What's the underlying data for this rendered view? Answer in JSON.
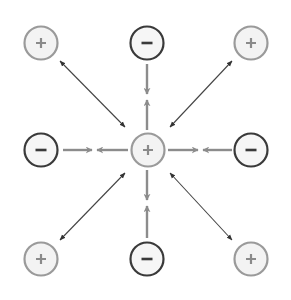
{
  "diagram": {
    "colors": {
      "background": "#ffffff",
      "positive_stroke": "#9a9a9a",
      "positive_fill": "#f3f3f3",
      "positive_sign": "#8a8a8a",
      "negative_stroke": "#3a3a3a",
      "negative_fill": "#f6f6f6",
      "negative_sign": "#3a3a3a",
      "attraction_arrow": "#8c8c8c",
      "diagonal_arrow": "#444444"
    },
    "nodes": [
      {
        "id": "top-left",
        "charge": "positive",
        "symbol": "+",
        "cx": 41,
        "cy": 43
      },
      {
        "id": "top-center",
        "charge": "negative",
        "symbol": "−",
        "cx": 147,
        "cy": 43
      },
      {
        "id": "top-right",
        "charge": "positive",
        "symbol": "+",
        "cx": 251,
        "cy": 43
      },
      {
        "id": "middle-left",
        "charge": "negative",
        "symbol": "−",
        "cx": 41,
        "cy": 150
      },
      {
        "id": "center",
        "charge": "positive",
        "symbol": "+",
        "cx": 148,
        "cy": 150
      },
      {
        "id": "middle-right",
        "charge": "negative",
        "symbol": "−",
        "cx": 251,
        "cy": 150
      },
      {
        "id": "bottom-left",
        "charge": "positive",
        "symbol": "+",
        "cx": 41,
        "cy": 259
      },
      {
        "id": "bottom-center",
        "charge": "negative",
        "symbol": "−",
        "cx": 147,
        "cy": 259
      },
      {
        "id": "bottom-right",
        "charge": "positive",
        "symbol": "+",
        "cx": 251,
        "cy": 259
      }
    ],
    "attraction_pairs": [
      {
        "between": [
          "top-center",
          "center"
        ],
        "type": "attraction",
        "meet": [
          147,
          97
        ]
      },
      {
        "between": [
          "middle-left",
          "center"
        ],
        "type": "attraction",
        "meet": [
          94,
          150
        ]
      },
      {
        "between": [
          "middle-right",
          "center"
        ],
        "type": "attraction",
        "meet": [
          200,
          150
        ]
      },
      {
        "between": [
          "bottom-center",
          "center"
        ],
        "type": "attraction",
        "meet": [
          147,
          203
        ]
      }
    ],
    "repulsion_links": [
      {
        "between": [
          "top-left",
          "center"
        ],
        "type": "double-headed"
      },
      {
        "between": [
          "top-right",
          "center"
        ],
        "type": "double-headed"
      },
      {
        "between": [
          "bottom-left",
          "center"
        ],
        "type": "double-headed"
      },
      {
        "between": [
          "bottom-right",
          "center"
        ],
        "type": "double-headed"
      }
    ]
  }
}
